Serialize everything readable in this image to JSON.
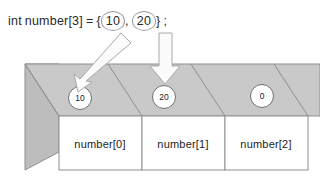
{
  "code": {
    "type_keyword": "int",
    "declaration": "number[3]",
    "equals": "=",
    "open_brace": "{",
    "value_1": "10",
    "comma": ",",
    "value_2": "20",
    "close_brace": "}",
    "semicolon": ";"
  },
  "diagram": {
    "type": "array-memory-box",
    "cells": [
      {
        "index": 0,
        "value": "10",
        "label": "number[0]"
      },
      {
        "index": 1,
        "value": "20",
        "label": "number[1]"
      },
      {
        "index": 2,
        "value": "0",
        "label": "number[2]"
      }
    ],
    "arrows": [
      {
        "name": "arrow-to-cell-0",
        "from_value": "10",
        "to_cell": "number[0]",
        "direction": "diagonal-down-left"
      },
      {
        "name": "arrow-to-cell-1",
        "from_value": "20",
        "to_cell": "number[1]",
        "direction": "straight-down"
      }
    ]
  },
  "colors": {
    "top_face": "#c9c9c9",
    "left_face": "#bdbdbd",
    "front_face": "#ffffff",
    "outline": "#8f8f8f",
    "text": "#222222",
    "background": "#ffffff"
  }
}
